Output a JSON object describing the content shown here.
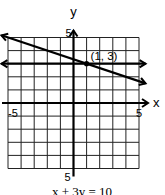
{
  "chart_data": {
    "type": "line",
    "title": "",
    "xlabel": "x",
    "ylabel": "y",
    "xlim": [
      -5,
      5
    ],
    "ylim": [
      -5,
      5
    ],
    "grid": true,
    "x_tick_labels": [
      "-5",
      "5"
    ],
    "x_ticks": [
      -5,
      5
    ],
    "y_tick_labels": [
      "5",
      "5"
    ],
    "y_ticks": [
      5,
      -5
    ],
    "series": [
      {
        "name": "x + 3y = 10",
        "equation": "x + 3y = 10",
        "points": [
          [
            -5.5,
            5.1667
          ],
          [
            5.5,
            1.5
          ]
        ],
        "arrows": "both"
      },
      {
        "name": "y = 3",
        "equation": "y = 3",
        "points": [
          [
            -5.5,
            3
          ],
          [
            5.5,
            3
          ]
        ],
        "arrows": "both"
      }
    ],
    "annotations": [
      {
        "text": "(1, 3)",
        "x": 1,
        "y": 3,
        "marker": "dot"
      }
    ],
    "caption": "x + 3y = 10"
  }
}
